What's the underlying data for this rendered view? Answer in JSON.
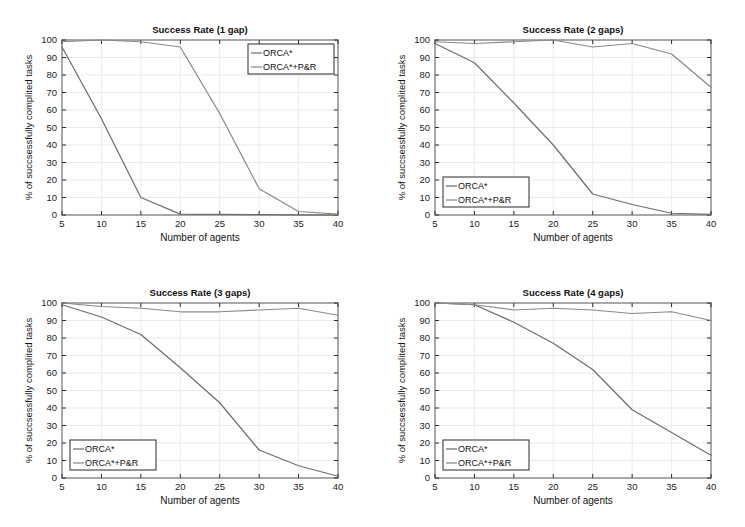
{
  "figure": {
    "background_color": "#ffffff",
    "series_colors": {
      "orca": "#6f6f6f",
      "orca_pr": "#8a8a8a"
    },
    "axis_color": "#2b2b2b",
    "grid_color": "#e2e2e6"
  },
  "common": {
    "xlabel": "Number of agents",
    "ylabel": "% of succsessfully complited tasks",
    "xticks": [
      5,
      10,
      15,
      20,
      25,
      30,
      35,
      40
    ],
    "yticks": [
      0,
      10,
      20,
      30,
      40,
      50,
      60,
      70,
      80,
      90,
      100
    ],
    "xlim": [
      5,
      40
    ],
    "ylim": [
      0,
      100
    ],
    "legend_entries": [
      "ORCA*",
      "ORCA*+P&R"
    ]
  },
  "chart_data": [
    {
      "id": "panel-1-gap",
      "type": "line",
      "title": "Success Rate (1 gap)",
      "xlabel": "Number of agents",
      "ylabel": "% of succsessfully complited tasks",
      "xlim": [
        5,
        40
      ],
      "ylim": [
        0,
        100
      ],
      "grid": true,
      "legend_position": "upper-right",
      "x": [
        5,
        10,
        15,
        20,
        25,
        30,
        35,
        40
      ],
      "series": [
        {
          "name": "ORCA*",
          "values": [
            96,
            55,
            10,
            0.5,
            0.3,
            0.2,
            0.1,
            0
          ]
        },
        {
          "name": "ORCA*+P&R",
          "values": [
            99,
            100,
            99,
            96,
            58,
            15,
            2,
            0.5
          ]
        }
      ]
    },
    {
      "id": "panel-2-gaps",
      "type": "line",
      "title": "Success Rate (2 gaps)",
      "xlabel": "Number of agents",
      "ylabel": "% of succsessfully complited tasks",
      "xlim": [
        5,
        40
      ],
      "ylim": [
        0,
        100
      ],
      "grid": true,
      "legend_position": "lower-left",
      "x": [
        5,
        10,
        15,
        20,
        25,
        30,
        35,
        40
      ],
      "series": [
        {
          "name": "ORCA*",
          "values": [
            98,
            87,
            64,
            40,
            12,
            6,
            1,
            0.3
          ]
        },
        {
          "name": "ORCA*+P&R",
          "values": [
            99,
            98,
            99,
            100,
            96,
            98,
            92,
            73
          ]
        }
      ]
    },
    {
      "id": "panel-3-gaps",
      "type": "line",
      "title": "Success Rate (3 gaps)",
      "xlabel": "Number of agents",
      "ylabel": "% of succsessfully complited tasks",
      "xlim": [
        5,
        40
      ],
      "ylim": [
        0,
        100
      ],
      "grid": true,
      "legend_position": "lower-left",
      "x": [
        5,
        10,
        15,
        20,
        25,
        30,
        35,
        40
      ],
      "series": [
        {
          "name": "ORCA*",
          "values": [
            99,
            92,
            82,
            63,
            43,
            16,
            7,
            1
          ]
        },
        {
          "name": "ORCA*+P&R",
          "values": [
            100,
            98,
            97,
            95,
            95,
            96,
            97,
            93
          ]
        }
      ]
    },
    {
      "id": "panel-4-gaps",
      "type": "line",
      "title": "Success Rate (4 gaps)",
      "xlabel": "Number of agents",
      "ylabel": "% of succsessfully complited tasks",
      "xlim": [
        5,
        40
      ],
      "ylim": [
        0,
        100
      ],
      "grid": true,
      "legend_position": "lower-left",
      "x": [
        5,
        10,
        15,
        20,
        25,
        30,
        35,
        40
      ],
      "series": [
        {
          "name": "ORCA*",
          "values": [
            100,
            99,
            89,
            77,
            62,
            39,
            26,
            13
          ]
        },
        {
          "name": "ORCA*+P&R",
          "values": [
            100,
            99,
            96,
            97,
            96,
            94,
            95,
            90
          ]
        }
      ]
    }
  ]
}
